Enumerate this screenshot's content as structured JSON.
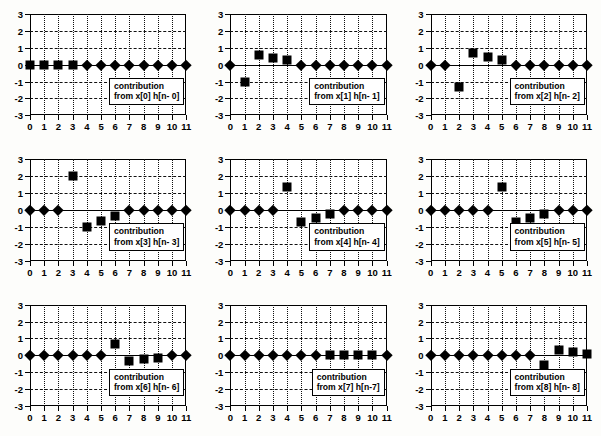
{
  "figure": {
    "title": "",
    "panel_count": 9,
    "rows": 3,
    "cols": 3
  },
  "axes": {
    "xticks": [
      "0",
      "1",
      "2",
      "3",
      "4",
      "5",
      "6",
      "7",
      "8",
      "9",
      "10",
      "11"
    ],
    "yticks": [
      "3",
      "2",
      "1",
      "0",
      "-1",
      "-2",
      "-3"
    ],
    "xlim": [
      0,
      11
    ],
    "ylim": [
      -3,
      3
    ],
    "xlabel": "",
    "ylabel": "",
    "grid": "on"
  },
  "colors": {
    "marker": "#000000",
    "frame": "#000000",
    "grid": "#111111",
    "background": "#ffffff",
    "page": "#fdfdfb"
  },
  "chart_data": {
    "type": "scatter",
    "title": "",
    "xlabel": "",
    "ylabel": "",
    "xlim": [
      0,
      11
    ],
    "ylim": [
      -3,
      3
    ],
    "grid": "on",
    "legend": "none",
    "x": [
      0,
      1,
      2,
      3,
      4,
      5,
      6,
      7,
      8,
      9,
      10,
      11
    ],
    "marker_types": {
      "sq": "filled-square",
      "di": "filled-diamond"
    },
    "panels": [
      {
        "index": 0,
        "annotation_line1": "contribution",
        "annotation_line2": "from  x[0] h[n- 0]",
        "values": [
          0,
          0,
          0,
          0,
          0,
          0,
          0,
          0,
          0,
          0,
          0,
          0
        ],
        "markers": [
          "sq",
          "sq",
          "sq",
          "sq",
          "di",
          "di",
          "di",
          "di",
          "di",
          "di",
          "di",
          "di"
        ]
      },
      {
        "index": 1,
        "annotation_line1": "contribution",
        "annotation_line2": "from  x[1] h[n- 1]",
        "values": [
          0,
          -1,
          0.55,
          0.4,
          0.3,
          0,
          0,
          0,
          0,
          0,
          0,
          0
        ],
        "markers": [
          "di",
          "sq",
          "sq",
          "sq",
          "sq",
          "di",
          "di",
          "di",
          "di",
          "di",
          "di",
          "di"
        ]
      },
      {
        "index": 2,
        "annotation_line1": "contribution",
        "annotation_line2": "from  x[2] h[n- 2]",
        "values": [
          0,
          0,
          -1.3,
          0.7,
          0.45,
          0.25,
          0,
          0,
          0,
          0,
          0,
          0
        ],
        "markers": [
          "di",
          "di",
          "sq",
          "sq",
          "sq",
          "sq",
          "di",
          "di",
          "di",
          "di",
          "di",
          "di"
        ]
      },
      {
        "index": 3,
        "annotation_line1": "contribution",
        "annotation_line2": "from  x[3] h[n- 3]",
        "values": [
          0,
          0,
          0,
          2,
          -1,
          -0.65,
          -0.35,
          0,
          0,
          0,
          0,
          0
        ],
        "markers": [
          "di",
          "di",
          "di",
          "sq",
          "sq",
          "sq",
          "sq",
          "di",
          "di",
          "di",
          "di",
          "di"
        ]
      },
      {
        "index": 4,
        "annotation_line1": "contribution",
        "annotation_line2": "from  x[4] h[n- 4]",
        "values": [
          0,
          0,
          0,
          0,
          1.35,
          -0.7,
          -0.45,
          -0.25,
          0,
          0,
          0,
          0
        ],
        "markers": [
          "di",
          "di",
          "di",
          "di",
          "sq",
          "sq",
          "sq",
          "sq",
          "di",
          "di",
          "di",
          "di"
        ]
      },
      {
        "index": 5,
        "annotation_line1": "contribution",
        "annotation_line2": "from  x[5] h[n- 5]",
        "values": [
          0,
          0,
          0,
          0,
          0,
          1.35,
          -0.7,
          -0.45,
          -0.25,
          0,
          0,
          0
        ],
        "markers": [
          "di",
          "di",
          "di",
          "di",
          "di",
          "sq",
          "sq",
          "sq",
          "sq",
          "di",
          "di",
          "di"
        ]
      },
      {
        "index": 6,
        "annotation_line1": "contribution",
        "annotation_line2": "from  x[6] h[n- 6]",
        "values": [
          0,
          0,
          0,
          0,
          0,
          0,
          0.65,
          -0.35,
          -0.2,
          -0.15,
          0,
          0
        ],
        "markers": [
          "di",
          "di",
          "di",
          "di",
          "di",
          "di",
          "sq",
          "sq",
          "sq",
          "sq",
          "di",
          "di"
        ]
      },
      {
        "index": 7,
        "annotation_line1": "contribution",
        "annotation_line2": "from  x[7] h[n-7]",
        "values": [
          0,
          0,
          0,
          0,
          0,
          0,
          0,
          0,
          0,
          0,
          0,
          0
        ],
        "markers": [
          "di",
          "di",
          "di",
          "di",
          "di",
          "di",
          "di",
          "sq",
          "sq",
          "sq",
          "sq",
          "di"
        ]
      },
      {
        "index": 8,
        "annotation_line1": "contribution",
        "annotation_line2": "from  x[8] h[n- 8]",
        "values": [
          0,
          0,
          0,
          0,
          0,
          0,
          0,
          0,
          -0.6,
          0.3,
          0.2,
          0.1
        ],
        "markers": [
          "di",
          "di",
          "di",
          "di",
          "di",
          "di",
          "di",
          "di",
          "sq",
          "sq",
          "sq",
          "sq"
        ]
      }
    ]
  }
}
